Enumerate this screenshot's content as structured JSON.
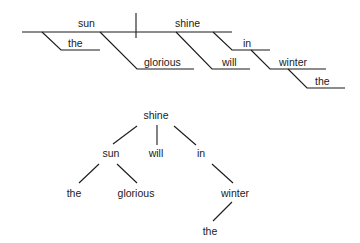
{
  "reed_kellogg_diagram": {
    "subject": "sun",
    "predicate": "shine",
    "modifiers": {
      "the_1": "the",
      "glorious": "glorious",
      "will": "will",
      "in": "in",
      "winter": "winter",
      "the_2": "the"
    }
  },
  "tree_diagram": {
    "root": "shine",
    "level1": {
      "sun": "sun",
      "will": "will",
      "in": "in"
    },
    "level2": {
      "the_1": "the",
      "glorious": "glorious",
      "winter": "winter"
    },
    "level3": {
      "the_2": "the"
    }
  },
  "colors": {
    "ink": "#1a1a1a",
    "background": "#ffffff"
  }
}
